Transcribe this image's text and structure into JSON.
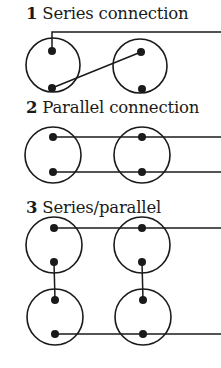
{
  "colors": {
    "ink": "#1a1a1a",
    "background": "#ffffff"
  },
  "sections": [
    {
      "number": "1",
      "label": "Series connection",
      "title_top": 6,
      "circles": [
        {
          "cx": 53,
          "cy": 65,
          "r": 27,
          "terminals": [
            [
              52,
              51
            ],
            [
              52,
              88
            ]
          ]
        },
        {
          "cx": 140,
          "cy": 66,
          "r": 27,
          "terminals": [
            [
              141,
              52
            ],
            [
              142,
              89
            ]
          ]
        }
      ],
      "wires": [
        [
          [
            52,
            51
          ],
          [
            52,
            32
          ],
          [
            221,
            32
          ]
        ],
        [
          [
            52,
            88
          ],
          [
            141,
            52
          ]
        ]
      ]
    },
    {
      "number": "2",
      "label": "Parallel connection",
      "title_top": 100,
      "circles": [
        {
          "cx": 53,
          "cy": 155,
          "r": 28,
          "terminals": [
            [
              53,
              137
            ],
            [
              53,
              172
            ]
          ]
        },
        {
          "cx": 142,
          "cy": 155,
          "r": 28,
          "terminals": [
            [
              142,
              137
            ],
            [
              142,
              172
            ]
          ]
        }
      ],
      "wires": [
        [
          [
            53,
            137
          ],
          [
            221,
            137
          ]
        ],
        [
          [
            53,
            172
          ],
          [
            221,
            172
          ]
        ]
      ]
    },
    {
      "number": "3",
      "label": "Series/parallel",
      "title_top": 200,
      "circles": [
        {
          "cx": 54,
          "cy": 245,
          "r": 28,
          "terminals": [
            [
              54,
              228
            ],
            [
              54,
              262
            ]
          ]
        },
        {
          "cx": 55,
          "cy": 317,
          "r": 28,
          "terminals": [
            [
              55,
              300
            ],
            [
              55,
              334
            ]
          ]
        },
        {
          "cx": 142,
          "cy": 245,
          "r": 28,
          "terminals": [
            [
              142,
              228
            ],
            [
              142,
              262
            ]
          ]
        },
        {
          "cx": 143,
          "cy": 317,
          "r": 28,
          "terminals": [
            [
              143,
              300
            ],
            [
              143,
              334
            ]
          ]
        }
      ],
      "wires": [
        [
          [
            54,
            228
          ],
          [
            221,
            228
          ]
        ],
        [
          [
            54,
            262
          ],
          [
            55,
            300
          ]
        ],
        [
          [
            142,
            262
          ],
          [
            143,
            300
          ]
        ],
        [
          [
            55,
            334
          ],
          [
            221,
            334
          ]
        ]
      ]
    }
  ]
}
